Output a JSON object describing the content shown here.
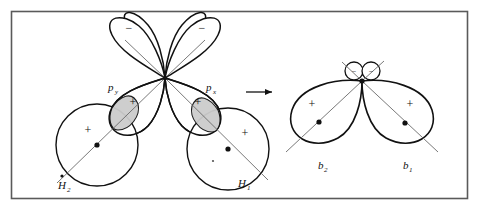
{
  "figure": {
    "background_color": "#ffffff",
    "border_color": "#5a5a5a",
    "stroke_color": "#111111",
    "thin_stroke_color": "#6a6a6a",
    "overlap_fill_color": "#cccccc",
    "transform_arrow": "→"
  },
  "left_panel": {
    "name": "reactant-orbitals",
    "p_orbitals": [
      {
        "id": "p-left",
        "label_main": "p",
        "label_sub": "y",
        "sign_top": "−",
        "sign_bottom": "+"
      },
      {
        "id": "p-right",
        "label_main": "p",
        "label_sub": "x",
        "sign_top": "−",
        "sign_bottom": "+"
      }
    ],
    "hydrogen_orbitals": [
      {
        "id": "h2",
        "label_main": "H",
        "label_sub": "2",
        "sign": "+"
      },
      {
        "id": "h1",
        "label_main": "H",
        "label_sub": "1",
        "sign": "+"
      }
    ],
    "overlap_regions": 2
  },
  "right_panel": {
    "name": "product-bond-orbitals",
    "bond_orbitals": [
      {
        "id": "b2",
        "label_main": "b",
        "label_sub": "2",
        "sign_major": "+",
        "sign_minor": "−"
      },
      {
        "id": "b1",
        "label_main": "b",
        "label_sub": "1",
        "sign_major": "+",
        "sign_minor": "−"
      }
    ],
    "small_lobe_count": 2
  }
}
